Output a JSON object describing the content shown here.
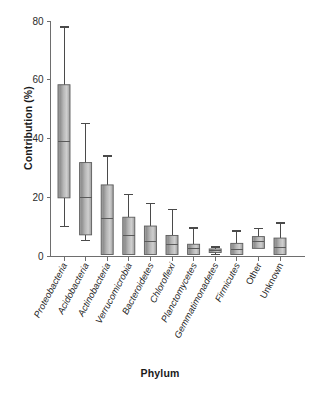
{
  "figure": {
    "xlabel": "Phylum",
    "ylabel": "Contribution (%)"
  },
  "chart_data": {
    "type": "box",
    "title": "",
    "xlabel": "Phylum",
    "ylabel": "Contribution (%)",
    "ylim": [
      0,
      80
    ],
    "yticks": [
      0,
      20,
      40,
      60,
      80
    ],
    "ytick_labels": [
      "0",
      "20",
      "40",
      "60",
      "80"
    ],
    "grid": false,
    "legend": null,
    "categories": [
      "Proteobacteria",
      "Acidobacteria",
      "Actinobacteria",
      "Verrucomicrobia",
      "Bacteroidetes",
      "Chloroflexi",
      "Planctomycetes",
      "Gemmatimonadetes",
      "Firmicutes",
      "Other",
      "Unknown"
    ],
    "category_styles": [
      "italic",
      "italic",
      "italic",
      "italic",
      "italic",
      "italic",
      "italic",
      "italic",
      "italic",
      "normal",
      "normal"
    ],
    "boxes": [
      {
        "label": "Proteobacteria",
        "whisker_low": 10.0,
        "q1": 19.8,
        "median": 39.0,
        "q3": 58.3,
        "whisker_high": 78.0
      },
      {
        "label": "Acidobacteria",
        "whisker_low": 5.2,
        "q1": 7.2,
        "median": 19.8,
        "q3": 31.8,
        "whisker_high": 45.2
      },
      {
        "label": "Actinobacteria",
        "whisker_low": 0.3,
        "q1": 0.5,
        "median": 12.8,
        "q3": 24.2,
        "whisker_high": 34.0
      },
      {
        "label": "Verrucomicrobia",
        "whisker_low": 0.3,
        "q1": 0.5,
        "median": 7.1,
        "q3": 13.2,
        "whisker_high": 21.0
      },
      {
        "label": "Bacteroidetes",
        "whisker_low": 0.3,
        "q1": 0.5,
        "median": 5.0,
        "q3": 10.2,
        "whisker_high": 17.8
      },
      {
        "label": "Chloroflexi",
        "whisker_low": 0.3,
        "q1": 0.5,
        "median": 3.9,
        "q3": 7.0,
        "whisker_high": 15.9
      },
      {
        "label": "Planctomycetes",
        "whisker_low": 0.3,
        "q1": 0.5,
        "median": 2.5,
        "q3": 4.0,
        "whisker_high": 9.5
      },
      {
        "label": "Gemmatimonadetes",
        "whisker_low": 0.6,
        "q1": 1.2,
        "median": 1.8,
        "q3": 2.4,
        "whisker_high": 3.1
      },
      {
        "label": "Firmicutes",
        "whisker_low": 0.3,
        "q1": 0.5,
        "median": 2.3,
        "q3": 4.3,
        "whisker_high": 8.5
      },
      {
        "label": "Other",
        "whisker_low": 2.3,
        "q1": 2.6,
        "median": 4.8,
        "q3": 6.6,
        "whisker_high": 9.4
      },
      {
        "label": "Unknown",
        "whisker_low": 0.3,
        "q1": 0.5,
        "median": 3.0,
        "q3": 6.1,
        "whisker_high": 11.2
      }
    ],
    "colors": {
      "box_fill_light": "#c9c9c9",
      "box_fill_dark": "#8d8d8d",
      "box_edge": "#5c5c5c",
      "whisker": "#4a4a4a",
      "axis": "#6e6e6e",
      "text": "#232323"
    }
  }
}
